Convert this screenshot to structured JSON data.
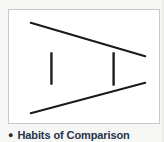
{
  "slide": {
    "background_color": "#f6f6f4"
  },
  "illustration": {
    "title": "ponzo-illusion",
    "panel_background": "#ffffff",
    "panel_border_color": "#c9c9c9",
    "stroke_color": "#1a1a1a",
    "converging_lines": [
      {
        "name": "upper-converging-line",
        "x1": 22,
        "y1": 13,
        "x2": 138,
        "y2": 47
      },
      {
        "name": "lower-converging-line",
        "x1": 22,
        "y1": 105,
        "x2": 138,
        "y2": 74
      }
    ],
    "vertical_bars": [
      {
        "name": "left-vertical-bar",
        "x": 43,
        "y1": 43,
        "y2": 76
      },
      {
        "name": "right-vertical-bar",
        "x": 106,
        "y1": 43,
        "y2": 77
      }
    ]
  },
  "caption": {
    "bullet": "●",
    "text": "Habits of Comparison",
    "color": "#23334a"
  }
}
